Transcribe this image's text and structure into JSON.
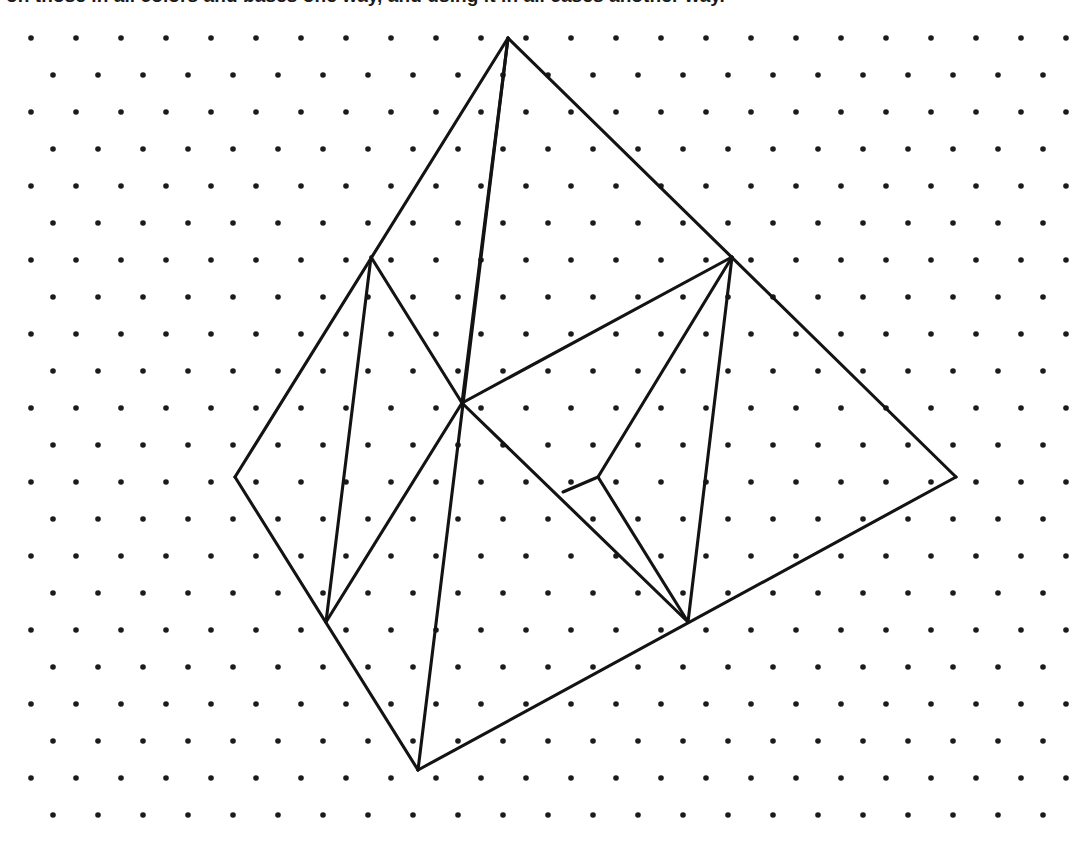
{
  "page": {
    "background_color": "#ffffff",
    "width": 1087,
    "height": 842
  },
  "caption": {
    "text": "on those in all colors and bases one way, and using it in all cases another way.",
    "clipped": true,
    "color": "#1a1a1a"
  },
  "grid": {
    "type": "isometric-triangular-dot-lattice",
    "dot_color": "#1b1b1b",
    "dot_radius": 2.8,
    "column_spacing": 45,
    "row_spacing": 37,
    "row_offset": 22.5,
    "first_row_y": 38,
    "even_row_start_x": 31,
    "odd_row_start_x": 53,
    "rows": 22,
    "columns_even": 24,
    "columns_odd": 23
  },
  "figure": {
    "stroke_color": "#131313",
    "stroke_width": 3.1,
    "vertices": {
      "apex": [
        508,
        38
      ],
      "left": [
        235,
        477
      ],
      "right": [
        956,
        477
      ],
      "bottom": [
        418,
        770
      ],
      "inner_upper_left": [
        371,
        257
      ],
      "inner_upper_right": [
        732,
        257
      ],
      "inner_lower_left": [
        326,
        622
      ],
      "inner_lower_right": [
        688,
        622
      ],
      "center_hub": [
        462,
        403
      ],
      "wedge_junction": [
        598,
        477
      ],
      "wedge_crossbar_end": [
        563,
        492
      ]
    },
    "segments": [
      {
        "name": "outer-apex-to-left",
        "from": "apex",
        "to": "left"
      },
      {
        "name": "outer-left-to-bottom",
        "from": "left",
        "to": "bottom"
      },
      {
        "name": "outer-bottom-to-right",
        "from": "bottom",
        "to": "right"
      },
      {
        "name": "outer-right-to-apex",
        "from": "right",
        "to": "apex"
      },
      {
        "name": "apex-to-bottom-long-diagonal",
        "from": "apex",
        "to": "bottom"
      },
      {
        "name": "apex-to-center-hub",
        "from": "apex",
        "to": "center_hub"
      },
      {
        "name": "inner-ul-to-inner-ll",
        "from": "inner_upper_left",
        "to": "inner_lower_left"
      },
      {
        "name": "inner-ul-to-center-hub",
        "from": "inner_upper_left",
        "to": "center_hub"
      },
      {
        "name": "center-hub-to-inner-ll",
        "from": "center_hub",
        "to": "inner_lower_left"
      },
      {
        "name": "center-hub-to-inner-ur",
        "from": "center_hub",
        "to": "inner_upper_right"
      },
      {
        "name": "center-hub-to-inner-lr",
        "from": "center_hub",
        "to": "inner_lower_right"
      },
      {
        "name": "inner-ur-to-inner-lr",
        "from": "inner_upper_right",
        "to": "inner_lower_right"
      },
      {
        "name": "inner-ur-to-wedge-junction",
        "from": "inner_upper_right",
        "to": "wedge_junction"
      },
      {
        "name": "wedge-junction-to-inner-lr",
        "from": "wedge_junction",
        "to": "inner_lower_right"
      },
      {
        "name": "wedge-crossbar",
        "from": "wedge_crossbar_end",
        "to": "wedge_junction"
      }
    ]
  }
}
